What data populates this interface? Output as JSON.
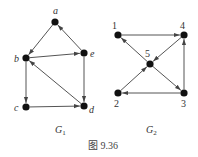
{
  "figure": {
    "caption": "图 9.36",
    "colors": {
      "node": "#111111",
      "edge": "#555555",
      "text": "#333333"
    }
  },
  "graphs": [
    {
      "name": "G1",
      "label_main": "G",
      "label_sub": "1",
      "label_pos": [
        55,
        133
      ],
      "nodes": [
        {
          "id": "a",
          "x": 55,
          "y": 22,
          "lx": 53,
          "ly": 14,
          "italic": true
        },
        {
          "id": "b",
          "x": 26,
          "y": 58,
          "lx": 14,
          "ly": 62,
          "italic": true
        },
        {
          "id": "e",
          "x": 84,
          "y": 53,
          "lx": 90,
          "ly": 57,
          "italic": true
        },
        {
          "id": "c",
          "x": 26,
          "y": 107,
          "lx": 14,
          "ly": 111,
          "italic": true
        },
        {
          "id": "d",
          "x": 84,
          "y": 106,
          "lx": 89,
          "ly": 113,
          "italic": true
        }
      ],
      "edges": [
        {
          "from": "a",
          "to": "b"
        },
        {
          "from": "e",
          "to": "a"
        },
        {
          "from": "b",
          "to": "e"
        },
        {
          "from": "b",
          "to": "c"
        },
        {
          "from": "c",
          "to": "d"
        },
        {
          "from": "e",
          "to": "d"
        },
        {
          "from": "d",
          "to": "b"
        }
      ]
    },
    {
      "name": "G2",
      "label_main": "G",
      "label_sub": "2",
      "label_pos": [
        146,
        133
      ],
      "nodes": [
        {
          "id": "1",
          "x": 118,
          "y": 35,
          "lx": 112,
          "ly": 29,
          "italic": false
        },
        {
          "id": "4",
          "x": 184,
          "y": 35,
          "lx": 180,
          "ly": 29,
          "italic": false
        },
        {
          "id": "5",
          "x": 150,
          "y": 64,
          "lx": 145,
          "ly": 57,
          "italic": false
        },
        {
          "id": "2",
          "x": 118,
          "y": 93,
          "lx": 114,
          "ly": 107,
          "italic": false
        },
        {
          "id": "3",
          "x": 184,
          "y": 93,
          "lx": 181,
          "ly": 107,
          "italic": false
        }
      ],
      "edges": [
        {
          "from": "1",
          "to": "4"
        },
        {
          "from": "4",
          "to": "5"
        },
        {
          "from": "5",
          "to": "1"
        },
        {
          "from": "2",
          "to": "5"
        },
        {
          "from": "5",
          "to": "3"
        },
        {
          "from": "3",
          "to": "4"
        },
        {
          "from": "3",
          "to": "2"
        }
      ]
    }
  ]
}
